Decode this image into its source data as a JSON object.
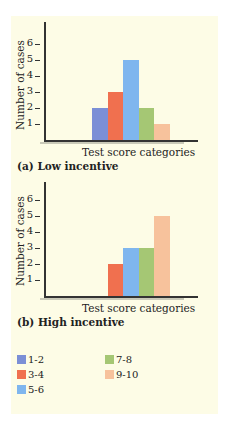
{
  "chart_data": [
    {
      "type": "bar",
      "title": "(a) Low incentive",
      "xlabel": "Test score categories",
      "ylabel": "Number of cases",
      "yticks": [
        1,
        2,
        3,
        4,
        5,
        6
      ],
      "ylim": [
        0,
        7
      ],
      "grid": false,
      "categories": [
        "1-2",
        "3-4",
        "5-6",
        "7-8",
        "9-10"
      ],
      "values": [
        2,
        3,
        5,
        2,
        1
      ]
    },
    {
      "type": "bar",
      "title": "(b) High incentive",
      "xlabel": "Test score categories",
      "ylabel": "Number of cases",
      "yticks": [
        1,
        2,
        3,
        4,
        5,
        6
      ],
      "ylim": [
        0,
        7
      ],
      "grid": false,
      "categories": [
        "1-2",
        "3-4",
        "5-6",
        "7-8",
        "9-10"
      ],
      "values": [
        0,
        2,
        3,
        3,
        5
      ]
    }
  ],
  "legend": {
    "position": "bottom",
    "entries": [
      {
        "label": "1-2",
        "color": "#7b8fd6"
      },
      {
        "label": "3-4",
        "color": "#f0704f"
      },
      {
        "label": "5-6",
        "color": "#7fb6ee"
      },
      {
        "label": "7-8",
        "color": "#a5c774"
      },
      {
        "label": "9-10",
        "color": "#f7c29c"
      }
    ]
  },
  "colors": {
    "panel_background": "#fdfce6",
    "axis": "#333333"
  }
}
